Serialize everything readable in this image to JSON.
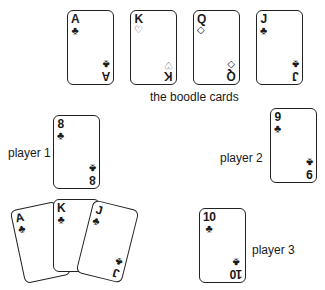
{
  "boodle": {
    "label": "the boodle cards",
    "cards": [
      {
        "rank": "A",
        "suit": "♣",
        "suit_name": "clubs"
      },
      {
        "rank": "K",
        "suit": "♡",
        "suit_name": "hearts"
      },
      {
        "rank": "Q",
        "suit": "◇",
        "suit_name": "diamonds"
      },
      {
        "rank": "J",
        "suit": "♣",
        "suit_name": "clubs"
      }
    ]
  },
  "player1": {
    "label": "player 1",
    "card": {
      "rank": "8",
      "suit": "♣",
      "suit_name": "clubs"
    },
    "hand": [
      {
        "rank": "A",
        "suit": "♣",
        "suit_name": "clubs"
      },
      {
        "rank": "K",
        "suit": "♣",
        "suit_name": "clubs"
      },
      {
        "rank": "J",
        "suit": "♣",
        "suit_name": "clubs"
      }
    ]
  },
  "player2": {
    "label": "player 2",
    "card": {
      "rank": "9",
      "suit": "♣",
      "suit_name": "clubs"
    }
  },
  "player3": {
    "label": "player 3",
    "card": {
      "rank": "10",
      "suit": "♣",
      "suit_name": "clubs"
    }
  }
}
